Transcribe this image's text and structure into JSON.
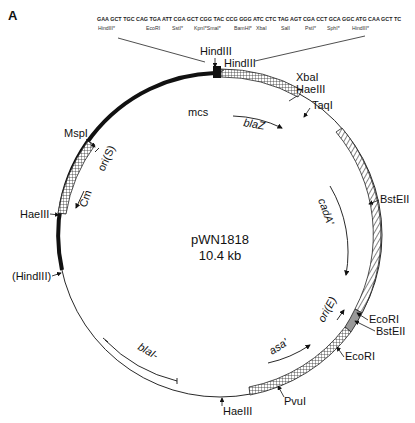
{
  "panel_label": "A",
  "plasmid": {
    "name": "pWN1818",
    "size": "10.4 kb"
  },
  "mcs_sequence": {
    "codons": "GAA GCT TGC CAG TGA ATT CGA GCT CGG TAC CCG GGG ATC CTC TAG AGT CGA CCT GCA GGC ATG CAA GCT TC",
    "sites": [
      "HindIII*",
      "EcoRI",
      "SstI*",
      "KpnI*SmaI*",
      "BamHI*",
      "XbaI",
      "SalI",
      "PstI*",
      "SphI*",
      "HindIII*"
    ]
  },
  "features": {
    "mcs": "mcs",
    "blaZ": "blaZ",
    "cadA": "cadA'",
    "oriE": "ori(E)",
    "asa": "asa'",
    "blaI": "blaI-",
    "Cm": "Cm",
    "oriS": "ori(S)"
  },
  "sites": {
    "hindIII_top1": "HindIII",
    "hindIII_top2": "HindIII",
    "xbaI": "XbaI",
    "haeIII_top": "HaeIII",
    "taqI": "TaqI",
    "bstEII_1": "BstEII",
    "ecoRI_1": "EcoRI",
    "bstEII_2": "BstEII",
    "ecoRI_2": "EcoRI",
    "pvuI": "PvuI",
    "haeIII_bottom": "HaeIII",
    "hindIII_paren": "(HindIII)",
    "haeIII_left": "HaeIII",
    "mspI": "MspI"
  }
}
